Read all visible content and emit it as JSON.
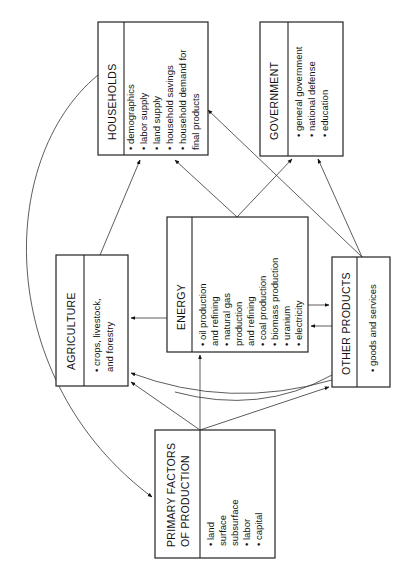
{
  "diagram": {
    "households": {
      "title": "HOUSEHOLDS",
      "items": [
        "• demographics",
        "• labor supply",
        "• land supply",
        "• household savings",
        "• household demand for",
        "   final products"
      ]
    },
    "government": {
      "title": "GOVERNMENT",
      "items": [
        "• general government",
        "• national defense",
        "• education"
      ]
    },
    "agriculture": {
      "title": "AGRICULTURE",
      "items": [
        "• crops, livestock,",
        "   and forestry"
      ]
    },
    "energy": {
      "title": "ENERGY",
      "items": [
        "• oil production",
        "   and refining",
        "• natural gas",
        "   production",
        "   and refining",
        "• coal production",
        "• biomass production",
        "• uranium",
        "• electricity"
      ]
    },
    "other_products": {
      "title": "OTHER PRODUCTS",
      "items": [
        "• goods and services"
      ]
    },
    "primary_factors": {
      "title_line1": "PRIMARY FACTORS",
      "title_line2": "OF PRODUCTION",
      "items": [
        "• land",
        "   surface",
        "   subsurface",
        "• labor",
        "• capital"
      ]
    }
  }
}
